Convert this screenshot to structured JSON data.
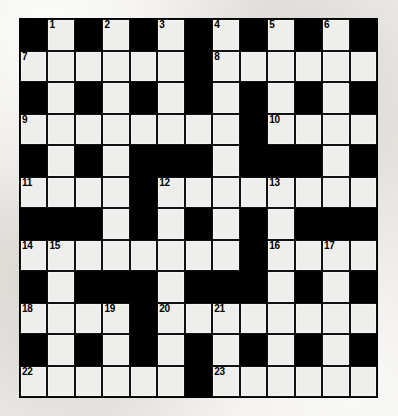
{
  "puzzle": {
    "title": "Crossword Grid",
    "type": "crossword",
    "columns": 13,
    "rows": 12,
    "colors": {
      "block": "#000000",
      "light": "#eeeeec",
      "paper": "#e9e8e4",
      "rule": "#111111",
      "number_text": "#000000"
    },
    "clue_numbers": [
      1,
      2,
      3,
      4,
      5,
      6,
      7,
      8,
      9,
      10,
      11,
      12,
      13,
      14,
      15,
      16,
      17,
      18,
      19,
      20,
      21,
      22,
      23
    ],
    "highest_number": 23,
    "legend": {
      "block_symbol": "#",
      "light_symbol": "."
    },
    "grid": [
      "#.#.#.#.#.#.#",
      "......#......",
      "#.#.#.#.#.#.#",
      "........#....",
      "#.#.###.###.#",
      "....#........",
      "###.#.#.#.###",
      "........#....",
      "#.###.###.#.#",
      "....#........",
      "#.#.#.#.#.#.#",
      "......#......"
    ],
    "numbered_cells": [
      {
        "n": 1,
        "row": 0,
        "col": 1
      },
      {
        "n": 2,
        "row": 0,
        "col": 3
      },
      {
        "n": 3,
        "row": 0,
        "col": 5
      },
      {
        "n": 4,
        "row": 0,
        "col": 7
      },
      {
        "n": 5,
        "row": 0,
        "col": 9
      },
      {
        "n": 6,
        "row": 0,
        "col": 11
      },
      {
        "n": 7,
        "row": 1,
        "col": 0
      },
      {
        "n": 8,
        "row": 1,
        "col": 7
      },
      {
        "n": 9,
        "row": 3,
        "col": 0
      },
      {
        "n": 10,
        "row": 3,
        "col": 9
      },
      {
        "n": 11,
        "row": 5,
        "col": 0
      },
      {
        "n": 12,
        "row": 5,
        "col": 5
      },
      {
        "n": 13,
        "row": 5,
        "col": 9
      },
      {
        "n": 14,
        "row": 7,
        "col": 0
      },
      {
        "n": 15,
        "row": 7,
        "col": 1
      },
      {
        "n": 16,
        "row": 7,
        "col": 9
      },
      {
        "n": 17,
        "row": 7,
        "col": 11
      },
      {
        "n": 18,
        "row": 9,
        "col": 0
      },
      {
        "n": 19,
        "row": 9,
        "col": 3
      },
      {
        "n": 20,
        "row": 9,
        "col": 5
      },
      {
        "n": 21,
        "row": 9,
        "col": 7
      },
      {
        "n": 22,
        "row": 11,
        "col": 0
      },
      {
        "n": 23,
        "row": 11,
        "col": 7
      }
    ]
  }
}
